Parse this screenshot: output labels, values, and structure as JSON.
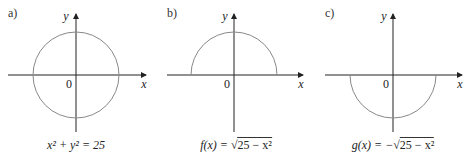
{
  "panels": [
    {
      "label": "a)",
      "caption": {
        "lhs": "x² + y² = 25"
      },
      "axis_x": "x",
      "axis_y": "y",
      "origin": "0",
      "curve": "full-circle"
    },
    {
      "label": "b)",
      "caption": {
        "lhs": "f(x) = ",
        "sqrt_symbol": "√",
        "radicand": "25 − x²"
      },
      "axis_x": "x",
      "axis_y": "y",
      "origin": "0",
      "curve": "upper-semicircle"
    },
    {
      "label": "c)",
      "caption": {
        "lhs": "g(x) = −",
        "sqrt_symbol": "√",
        "radicand": "25 − x²"
      },
      "axis_x": "x",
      "axis_y": "y",
      "origin": "0",
      "curve": "lower-semicircle"
    }
  ],
  "colors": {
    "axis": "#222222",
    "curve": "#888888"
  }
}
